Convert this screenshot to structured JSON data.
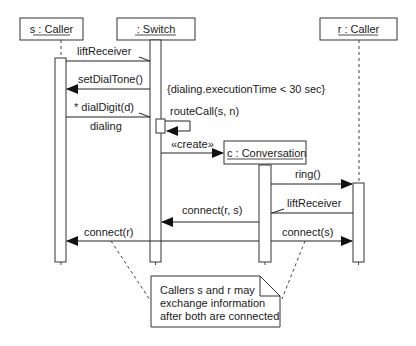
{
  "diagram": {
    "type": "UML sequence diagram",
    "lifelines": [
      {
        "id": "s",
        "label": "s : Caller"
      },
      {
        "id": "switch",
        "label": ": Switch"
      },
      {
        "id": "c",
        "label": "c : Conversation"
      },
      {
        "id": "r",
        "label": "r : Caller"
      }
    ],
    "messages": [
      {
        "label": "liftReceiver",
        "from": "s",
        "to": "switch",
        "kind": "asynchronous"
      },
      {
        "label": "setDialTone()",
        "from": "switch",
        "to": "s",
        "kind": "synchronous"
      },
      {
        "label": "* dialDigit(d)",
        "from": "s",
        "to": "switch",
        "kind": "asynchronous"
      },
      {
        "label": "dialing",
        "from": "s",
        "to": "switch",
        "kind": "mark"
      },
      {
        "label": "routeCall(s, n)",
        "from": "switch",
        "to": "switch",
        "kind": "self-call"
      },
      {
        "label": "«create»",
        "from": "switch",
        "to": "c",
        "kind": "create"
      },
      {
        "label": "ring()",
        "from": "c",
        "to": "r",
        "kind": "synchronous"
      },
      {
        "label": "liftReceiver",
        "from": "r",
        "to": "c",
        "kind": "asynchronous"
      },
      {
        "label": "connect(r, s)",
        "from": "c",
        "to": "switch",
        "kind": "synchronous"
      },
      {
        "label": "connect(r)",
        "from": "switch",
        "to": "s",
        "kind": "synchronous"
      },
      {
        "label": "connect(s)",
        "from": "c",
        "to": "r",
        "kind": "synchronous"
      }
    ],
    "constraint": "{dialing.executionTime < 30 sec}",
    "note": {
      "lines": [
        "Callers s and r may",
        "exchange information",
        "after both are connected"
      ]
    }
  }
}
